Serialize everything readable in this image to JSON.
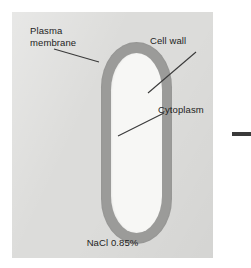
{
  "figure": {
    "caption": "NaCl 0.85%"
  },
  "labels": {
    "plasma_membrane": "Plasma\nmembrane",
    "cell_wall": "Cell wall",
    "cytoplasm": "Cytoplasm"
  },
  "colors": {
    "panel_background": "#dcdcda",
    "cell_wall": "#9b9b99",
    "cytoplasm": "#f7f7f5",
    "text": "#1d1d1d",
    "leader_line": "#3a3a3a",
    "connector": "#3a3a3a"
  },
  "geometry": {
    "panel": {
      "x": 12,
      "y": 12,
      "width": 201,
      "height": 246
    },
    "cell": {
      "x": 89,
      "y": 30,
      "width": 71,
      "height": 202,
      "wall_thickness": 10
    },
    "connector_bar": {
      "x": 232,
      "y": 132,
      "width": 19,
      "height": 4
    }
  }
}
